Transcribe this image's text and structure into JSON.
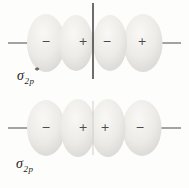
{
  "diagram": {
    "type": "molecular-orbital-diagram",
    "colors": {
      "background": "#fdfdfc",
      "lobe_highlight": "#f8f7f5",
      "lobe_mid": "#eceae6",
      "lobe_edge": "#d7d5d1",
      "axis_line": "#4c4a48",
      "nodal_line": "#3e3d3b",
      "seam_line": "#cfcdc9",
      "sign": "#4a4a4a",
      "label": "#1e1d1b"
    },
    "orbitals": [
      {
        "name": "sigma-2p-antibonding",
        "label": {
          "symbol": "σ",
          "subscript": "2p",
          "superscript": "*"
        },
        "lobe_signs": [
          "−",
          "+",
          "−",
          "+"
        ],
        "nodal_plane": true
      },
      {
        "name": "sigma-2p-bonding",
        "label": {
          "symbol": "σ",
          "subscript": "2p",
          "superscript": ""
        },
        "lobe_signs": [
          "−",
          "+",
          "+",
          "−"
        ],
        "nodal_plane": false
      }
    ]
  }
}
